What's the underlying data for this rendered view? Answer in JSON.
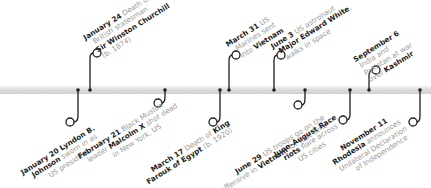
{
  "timeline": {
    "year": "1965",
    "colors": {
      "line": "#1e1e1e",
      "axis": "#d6d6d6",
      "date": "#1e1e1e",
      "text": "#9a9a9a"
    },
    "events": [
      {
        "id": "jan20",
        "side": "below",
        "date": "January 20",
        "lines": [
          [
            "Lyndon B."
          ],
          [
            "Johnson",
            " sworn in as"
          ],
          [
            "US president"
          ]
        ],
        "bold_segments": [
          "Lyndon B.",
          "Johnson"
        ]
      },
      {
        "id": "jan24",
        "side": "above",
        "date": "January 24",
        "lines": [
          [
            " Death of"
          ],
          [
            "British statesman"
          ],
          [
            "Sir Winston Churchill"
          ],
          [
            "(b. 1874)"
          ]
        ],
        "bold_segments": [
          "Sir Winston Churchill"
        ]
      },
      {
        "id": "feb21",
        "side": "below",
        "date": "February 21",
        "lines": [
          [
            " Black Muslim"
          ],
          [
            "leader ",
            "Malcolm X",
            " shot dead"
          ],
          [
            "in New York, US"
          ]
        ],
        "bold_segments": [
          "Malcolm X"
        ]
      },
      {
        "id": "mar17",
        "side": "below",
        "date": "March 17",
        "lines": [
          [
            " Death of ",
            "King"
          ],
          [
            "Farouk of Egypt",
            " (b. 1920)"
          ]
        ],
        "bold_segments": [
          "King",
          "Farouk of Egypt"
        ]
      },
      {
        "id": "mar31",
        "side": "above",
        "date": "March 31",
        "lines": [
          [
            " US"
          ],
          [
            "Marines sent"
          ],
          [
            "into ",
            "Vietnam"
          ]
        ],
        "bold_segments": [
          "Vietnam"
        ]
      },
      {
        "id": "jun3",
        "side": "above",
        "date": "June 3",
        "lines": [
          [
            " US astronaut"
          ],
          [
            "Major Edward White",
            ","
          ],
          [
            "walks in space"
          ]
        ],
        "bold_segments": [
          "Major Edward White"
        ]
      },
      {
        "id": "jun29",
        "side": "below",
        "date": "June 29",
        "lines": [
          [
            " US troops go on the"
          ],
          [
            "offensive in ",
            "Vietnam",
            " for first time"
          ]
        ],
        "bold_segments": [
          "Vietnam"
        ]
      },
      {
        "id": "junaug",
        "side": "below",
        "date": "June–August",
        "lines": [
          [
            " Race"
          ],
          [
            "riots",
            " flare across"
          ],
          [
            "US cities"
          ]
        ],
        "bold_segments": [
          "Race",
          "riots"
        ]
      },
      {
        "id": "sep6",
        "side": "above",
        "date": "September 6",
        "lines": [
          [
            "India and"
          ],
          [
            "Pakistan at war"
          ],
          [
            "over ",
            "Kashmir"
          ]
        ],
        "bold_segments": [
          "Kashmir"
        ]
      },
      {
        "id": "nov11",
        "side": "below",
        "date": "November 11",
        "lines": [
          [
            "Rhodesia",
            " announces"
          ],
          [
            "Unilateral Declaration"
          ],
          [
            "of Independence"
          ]
        ],
        "bold_segments": [
          "Rhodesia"
        ]
      }
    ]
  }
}
